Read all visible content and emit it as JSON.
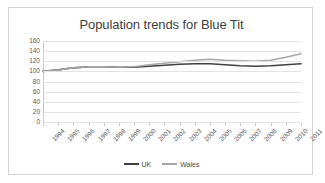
{
  "frame": {
    "border_color": "#d4d4d4",
    "background": "#ffffff"
  },
  "chart_data": {
    "type": "line",
    "title": "Population trends for Blue Tit",
    "xlabel": "",
    "ylabel": "",
    "ylim": [
      0,
      160
    ],
    "ytick_step": 20,
    "yticks": [
      160,
      140,
      120,
      100,
      80,
      60,
      40,
      20,
      0
    ],
    "grid": true,
    "grid_axis": "y",
    "legend_position": "bottom",
    "categories": [
      "1994",
      "1995",
      "1996",
      "1997",
      "1998",
      "1999",
      "2000",
      "2001",
      "2002",
      "2003",
      "2004",
      "2005",
      "2006",
      "2007",
      "2008",
      "2009",
      "2010",
      "2011"
    ],
    "series": [
      {
        "name": "UK",
        "color": "#404040",
        "values": [
          100,
          103,
          107,
          109,
          109,
          108,
          108,
          110,
          112,
          114,
          115,
          115,
          113,
          111,
          110,
          111,
          113,
          115
        ]
      },
      {
        "name": "Wales",
        "color": "#a6a6a6",
        "values": [
          100,
          103,
          107,
          109,
          109,
          108,
          109,
          113,
          116,
          119,
          122,
          124,
          122,
          121,
          120,
          122,
          128,
          135
        ]
      }
    ]
  },
  "legend": {
    "items": [
      {
        "label": "UK",
        "color": "#404040"
      },
      {
        "label": "Wales",
        "color": "#a6a6a6"
      }
    ]
  }
}
